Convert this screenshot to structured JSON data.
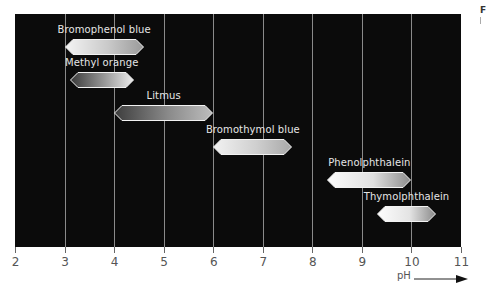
{
  "chart_data": {
    "type": "bar",
    "subtype": "horizontal range (floating bars)",
    "title": "",
    "xlabel": "pH",
    "ylabel": "",
    "xlim": [
      2,
      11
    ],
    "x_ticks": [
      2,
      3,
      4,
      5,
      6,
      7,
      8,
      9,
      10,
      11
    ],
    "grid": "vertical lines at each integer pH",
    "legend": "none",
    "series": [
      {
        "name": "Bromophenol blue",
        "start": 3.0,
        "end": 4.6
      },
      {
        "name": "Methyl orange",
        "start": 3.1,
        "end": 4.4
      },
      {
        "name": "Litmus",
        "start": 4.0,
        "end": 6.0
      },
      {
        "name": "Bromothymol blue",
        "start": 6.0,
        "end": 7.6
      },
      {
        "name": "Phenolphthalein",
        "start": 8.3,
        "end": 10.0
      },
      {
        "name": "Thymolphthalein",
        "start": 9.3,
        "end": 10.5
      }
    ]
  },
  "axis": {
    "tick_labels": [
      "2",
      "3",
      "4",
      "5",
      "6",
      "7",
      "8",
      "9",
      "10",
      "11"
    ],
    "xlabel": "pH"
  },
  "corner_text": "F",
  "colors": {
    "plot_bg": "#0b0b0b",
    "grid": "#8a8a8a",
    "label_text": "#e6e6e6",
    "axis_text": "#555555"
  }
}
